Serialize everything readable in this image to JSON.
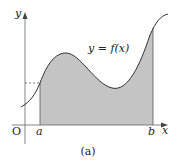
{
  "diagram": {
    "curve_label": "y = f(x)",
    "y_axis_label": "y",
    "x_axis_label": "x",
    "origin_label": "O",
    "a_label": "a",
    "b_label": "b",
    "caption": "(a)",
    "colors": {
      "shaded_area": "#c4c4c4",
      "curve": "#333333",
      "axes": "#555555",
      "background": "#ffffff"
    }
  }
}
